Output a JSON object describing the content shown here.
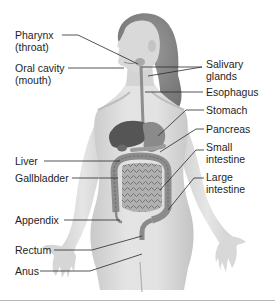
{
  "figure": {
    "colors": {
      "skin_light": "#e6e6e6",
      "skin_mid": "#cfcfcf",
      "skin_shadow": "#b5b5b5",
      "hair": "#8a8a8a",
      "organ_dark": "#5a5a5a",
      "organ_mid": "#8c8c8c",
      "intestine": "#a8a8a8",
      "leader_line": "#2a2a2a",
      "text": "#1e1e1e",
      "rule": "#b8b8b8"
    },
    "labels_left": [
      {
        "id": "pharynx",
        "line1": "Pharynx",
        "line2": "(throat)"
      },
      {
        "id": "oral-cavity",
        "line1": "Oral cavity",
        "line2": "(mouth)"
      },
      {
        "id": "liver",
        "line1": "Liver",
        "line2": ""
      },
      {
        "id": "gallbladder",
        "line1": "Gallbladder",
        "line2": ""
      },
      {
        "id": "appendix",
        "line1": "Appendix",
        "line2": ""
      },
      {
        "id": "rectum",
        "line1": "Rectum",
        "line2": ""
      },
      {
        "id": "anus",
        "line1": "Anus",
        "line2": ""
      }
    ],
    "labels_right": [
      {
        "id": "salivary-glands",
        "line1": "Salivary",
        "line2": "glands"
      },
      {
        "id": "esophagus",
        "line1": "Esophagus",
        "line2": ""
      },
      {
        "id": "stomach",
        "line1": "Stomach",
        "line2": ""
      },
      {
        "id": "pancreas",
        "line1": "Pancreas",
        "line2": ""
      },
      {
        "id": "small-intestine",
        "line1": "Small",
        "line2": "intestine"
      },
      {
        "id": "large-intestine",
        "line1": "Large",
        "line2": "intestine"
      }
    ]
  }
}
